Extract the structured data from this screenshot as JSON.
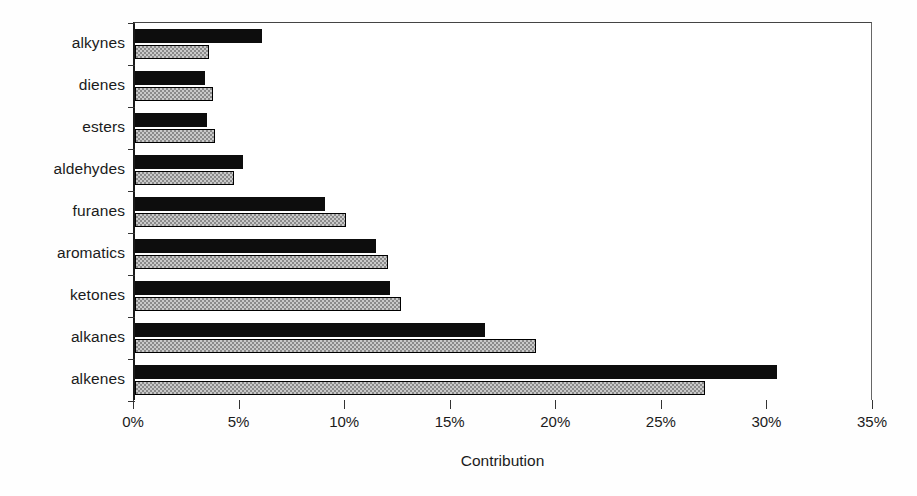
{
  "chart_data": {
    "type": "bar",
    "orientation": "horizontal",
    "title": "",
    "xlabel": "Contribution",
    "ylabel": "",
    "xlim": [
      0,
      35
    ],
    "xunit": "%",
    "grid": false,
    "legend": null,
    "categories": [
      "alkynes",
      "dienes",
      "esters",
      "aldehydes",
      "furanes",
      "aromatics",
      "ketones",
      "alkanes",
      "alkenes"
    ],
    "tick_labels": [
      "0%",
      "5%",
      "10%",
      "15%",
      "20%",
      "25%",
      "30%",
      "35%"
    ],
    "tick_values": [
      0,
      5,
      10,
      15,
      20,
      25,
      30,
      35
    ],
    "series": [
      {
        "name": "series-black",
        "style": "solid-black",
        "color": "#0d0d0d",
        "values": [
          6.0,
          3.3,
          3.4,
          5.1,
          9.0,
          11.4,
          12.1,
          16.6,
          30.4
        ]
      },
      {
        "name": "series-hatched",
        "style": "checkered-gray",
        "color": "#c9c9c9",
        "values": [
          3.5,
          3.7,
          3.8,
          4.7,
          10.0,
          12.0,
          12.6,
          19.0,
          27.0
        ]
      }
    ]
  }
}
